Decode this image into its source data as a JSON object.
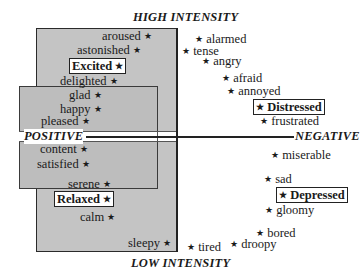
{
  "axes": {
    "top": "HIGH INTENSITY",
    "bottom": "LOW INTENSITY",
    "left": "POSITIVE",
    "right": "NEGATIVE"
  },
  "star": "★",
  "positive": {
    "aroused": "aroused",
    "astonished": "astonished",
    "excited": "Excited",
    "delighted": "delighted",
    "glad": "glad",
    "happy": "happy",
    "pleased": "pleased",
    "content": "content",
    "satisfied": "satisfied",
    "serene": "serene",
    "relaxed": "Relaxed",
    "calm": "calm",
    "sleepy": "sleepy"
  },
  "negative": {
    "alarmed": "alarmed",
    "tense": "tense",
    "angry": "angry",
    "afraid": "afraid",
    "annoyed": "annoyed",
    "distressed": "Distressed",
    "frustrated": "frustrated",
    "miserable": "miserable",
    "sad": "sad",
    "depressed": "Depressed",
    "gloomy": "gloomy",
    "bored": "bored",
    "droopy": "droopy",
    "tired": "tired"
  },
  "colors": {
    "box_fill": "#c4c4c4",
    "overlap_fill": "#bdbdbd",
    "border": "#2a2a2a"
  }
}
